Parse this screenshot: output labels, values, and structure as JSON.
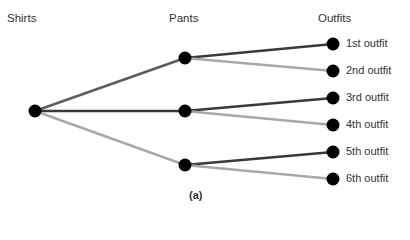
{
  "diagram": {
    "type": "tree-diagram",
    "headers": {
      "shirts": "Shirts",
      "pants": "Pants",
      "outfits": "Outfits"
    },
    "caption": "(a)",
    "colors": {
      "node": "#000000",
      "dark_branch": "#3a3a3a",
      "medium_branch": "#5c5c5c",
      "light_branch": "#a8a8a8"
    },
    "outfits": [
      {
        "label": "1st outfit"
      },
      {
        "label": "2nd outfit"
      },
      {
        "label": "3rd outfit"
      },
      {
        "label": "4th outfit"
      },
      {
        "label": "5th outfit"
      },
      {
        "label": "6th outfit"
      }
    ]
  }
}
